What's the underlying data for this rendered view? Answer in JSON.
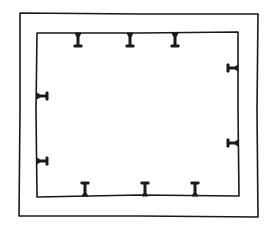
{
  "diagram": {
    "style": "hand-drawn sketch",
    "stroke_color": "#1a1a1a",
    "background": "#ffffff",
    "outer_frame": {
      "x1": 19,
      "y1": 12,
      "x2": 258,
      "y2": 217
    },
    "inner_rect": {
      "x1": 36,
      "y1": 32,
      "x2": 239,
      "y2": 197
    },
    "markers": {
      "top": [
        78,
        130,
        175
      ],
      "bottom": [
        85,
        145,
        195
      ],
      "left": [
        96,
        161
      ],
      "right": [
        68,
        143
      ]
    },
    "marker_shape": "T-bracket",
    "marker_count": 10
  }
}
